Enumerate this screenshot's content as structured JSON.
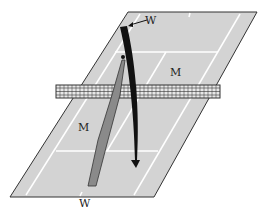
{
  "diagram": {
    "labels": {
      "top_player": "W",
      "bottom_player": "W",
      "far_court_player": "M",
      "near_court_player": "M"
    },
    "colors": {
      "court": "#d3d3d3",
      "lines": "#ffffff",
      "outline": "#333333",
      "shot_black": "#111111",
      "shot_grey": "#8a8a8a",
      "net": "#333333"
    }
  }
}
